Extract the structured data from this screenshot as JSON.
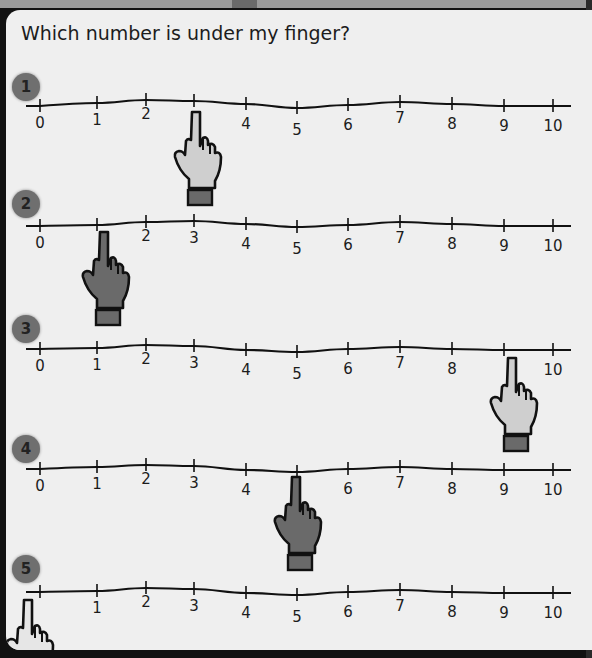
{
  "header": {
    "title": "Which number is under my finger?"
  },
  "questions": [
    {
      "number": "1",
      "hand_color": "#cfcfcf",
      "hand_points_at": "3"
    },
    {
      "number": "2",
      "hand_color": "#6a6a6a",
      "hand_points_at": "1"
    },
    {
      "number": "3",
      "hand_color": "#cfcfcf",
      "hand_points_at": "9"
    },
    {
      "number": "4",
      "hand_color": "#6a6a6a",
      "hand_points_at": "5"
    },
    {
      "number": "5",
      "hand_color": "#e6e6e6",
      "hand_points_at": "0"
    }
  ],
  "number_line": {
    "labels": [
      "0",
      "1",
      "2",
      "3",
      "4",
      "5",
      "6",
      "7",
      "8",
      "9",
      "10"
    ]
  },
  "lines": [
    {
      "hidden_label": "3",
      "labels": [
        "0",
        "1",
        "2",
        "",
        "4",
        "5",
        "6",
        "7",
        "8",
        "9",
        "10"
      ]
    },
    {
      "hidden_label": "1",
      "labels": [
        "0",
        "",
        "2",
        "3",
        "4",
        "5",
        "6",
        "7",
        "8",
        "9",
        "10"
      ]
    },
    {
      "hidden_label": "9",
      "labels": [
        "0",
        "1",
        "2",
        "3",
        "4",
        "5",
        "6",
        "7",
        "8",
        "",
        "10"
      ]
    },
    {
      "hidden_label": "5",
      "labels": [
        "0",
        "1",
        "2",
        "3",
        "4",
        "",
        "6",
        "7",
        "8",
        "9",
        "10"
      ]
    },
    {
      "hidden_label": "0",
      "labels": [
        "",
        "1",
        "2",
        "3",
        "4",
        "5",
        "6",
        "7",
        "8",
        "9",
        "10"
      ]
    }
  ],
  "colors": {
    "background": "#efefef",
    "frame": "#111111",
    "circle": "#6f6f6f"
  }
}
